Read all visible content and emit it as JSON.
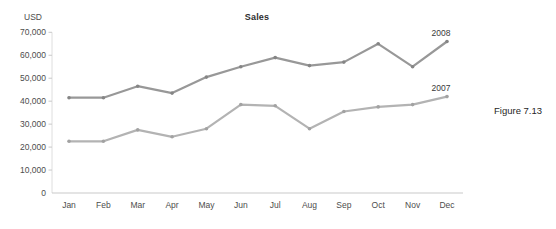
{
  "figure_caption": "Figure 7.13",
  "chart_data": {
    "type": "line",
    "title": "Sales",
    "unit_label": "USD",
    "xlabel": "",
    "ylabel": "USD",
    "ylim": [
      0,
      70000
    ],
    "grid": false,
    "legend_position": "labels-at-line-end",
    "categories": [
      "Jan",
      "Feb",
      "Mar",
      "Apr",
      "May",
      "Jun",
      "Jul",
      "Aug",
      "Sep",
      "Oct",
      "Nov",
      "Dec"
    ],
    "y_tick_values": [
      0,
      10000,
      20000,
      30000,
      40000,
      50000,
      60000,
      70000
    ],
    "y_tick_labels": [
      "0",
      "10,000",
      "20,000",
      "30,000",
      "40,000",
      "50,000",
      "60,000",
      "70,000"
    ],
    "axis_color": "#c9c9c9",
    "vertical_axis_color": "#dedede",
    "tick_label_color": "#4d4d4d",
    "series": [
      {
        "name": "2008",
        "color": "#989898",
        "marker_color": "#858585",
        "values": [
          41500,
          41500,
          46500,
          43500,
          50500,
          55000,
          59000,
          55500,
          57000,
          65000,
          55000,
          66000
        ]
      },
      {
        "name": "2007",
        "color": "#b3b3b3",
        "marker_color": "#a2a2a2",
        "values": [
          22500,
          22500,
          27500,
          24500,
          28000,
          38500,
          38000,
          28000,
          35500,
          37500,
          38500,
          42000
        ]
      }
    ]
  }
}
